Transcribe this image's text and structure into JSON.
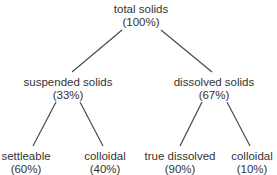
{
  "diagram": {
    "type": "tree",
    "title": "",
    "root": {
      "label": "total solids",
      "percent": "(100%)",
      "children": [
        {
          "label": "suspended solids",
          "percent": "(33%)",
          "children": [
            {
              "label": "settleable",
              "percent": "(60%)"
            },
            {
              "label": "colloidal",
              "percent": "(40%)"
            }
          ]
        },
        {
          "label": "dissolved solids",
          "percent": "(67%)",
          "children": [
            {
              "label": "true dissolved",
              "percent": "(90%)"
            },
            {
              "label": "colloidal",
              "percent": "(10%)"
            }
          ]
        }
      ]
    },
    "colors": {
      "text": "#333333",
      "line": "#4a4a4a",
      "background": "#ffffff"
    }
  }
}
